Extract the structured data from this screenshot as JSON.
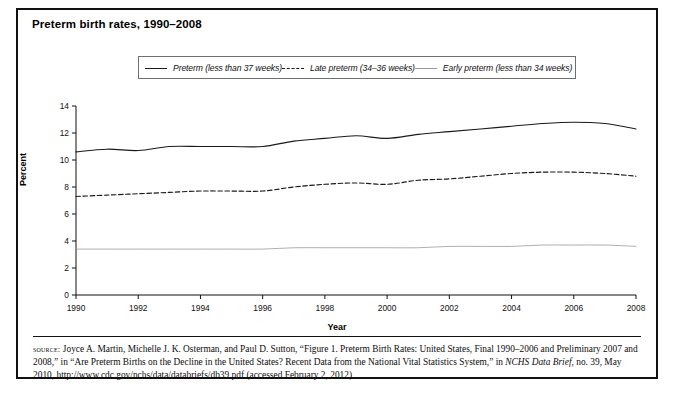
{
  "figure": {
    "title": "Preterm birth rates, 1990–2008",
    "xlabel": "Year",
    "ylabel": "Percent"
  },
  "legend": {
    "items": [
      {
        "label": "Preterm (less than 37 weeks)",
        "style": "solid",
        "color": "#1a1a1a"
      },
      {
        "label": "Late preterm (34–36 weeks)",
        "style": "dashed",
        "color": "#1a1a1a"
      },
      {
        "label": "Early preterm (less than 34 weeks)",
        "style": "light-solid",
        "color": "#9a9a9a"
      }
    ]
  },
  "source": {
    "prefix": "source:",
    "body_1": " Joyce A. Martin, Michelle J. K. Osterman, and Paul D. Sutton, “Figure 1. Preterm Birth Rates: United States, Final 1990–2006 and Preliminary 2007 and 2008,” in “Are Preterm Births on the Decline in the United States? Recent Data from the National Vital Statistics System,” in ",
    "italic_1": "NCHS Data Brief",
    "body_2": ", no. 39, May 2010, http://www.cdc.gov/nchs/data/databriefs/db39.pdf (accessed February 2, 2012)"
  },
  "chart_data": {
    "type": "line",
    "title": "Preterm birth rates, 1990–2008",
    "xlabel": "Year",
    "ylabel": "Percent",
    "xlim": [
      1990,
      2008
    ],
    "ylim": [
      0,
      14
    ],
    "ytick_step": 2,
    "xtick_step": 2,
    "xticks": [
      1990,
      1992,
      1994,
      1996,
      1998,
      2000,
      2002,
      2004,
      2006,
      2008
    ],
    "yticks": [
      0,
      2,
      4,
      6,
      8,
      10,
      12,
      14
    ],
    "grid": false,
    "legend_position": "top",
    "x": [
      1990,
      1991,
      1992,
      1993,
      1994,
      1995,
      1996,
      1997,
      1998,
      1999,
      2000,
      2001,
      2002,
      2003,
      2004,
      2005,
      2006,
      2007,
      2008
    ],
    "series": [
      {
        "name": "Preterm (less than 37 weeks)",
        "style": "solid",
        "color": "#1a1a1a",
        "values": [
          10.6,
          10.8,
          10.7,
          11.0,
          11.0,
          11.0,
          11.0,
          11.4,
          11.6,
          11.8,
          11.6,
          11.9,
          12.1,
          12.3,
          12.5,
          12.7,
          12.8,
          12.7,
          12.3
        ]
      },
      {
        "name": "Late preterm (34–36 weeks)",
        "style": "dashed",
        "color": "#1a1a1a",
        "values": [
          7.3,
          7.4,
          7.5,
          7.6,
          7.7,
          7.7,
          7.7,
          8.0,
          8.2,
          8.3,
          8.2,
          8.5,
          8.6,
          8.8,
          9.0,
          9.1,
          9.1,
          9.0,
          8.8
        ]
      },
      {
        "name": "Early preterm (less than 34 weeks)",
        "style": "light-solid",
        "color": "#9a9a9a",
        "values": [
          3.4,
          3.4,
          3.4,
          3.4,
          3.4,
          3.4,
          3.4,
          3.5,
          3.5,
          3.5,
          3.5,
          3.5,
          3.6,
          3.6,
          3.6,
          3.7,
          3.7,
          3.7,
          3.6
        ]
      }
    ]
  }
}
